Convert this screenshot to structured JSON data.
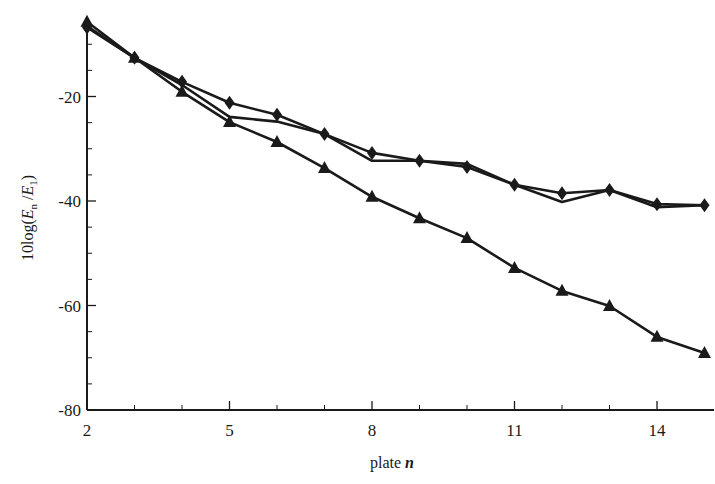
{
  "chart_data": {
    "type": "line",
    "title": "",
    "xlabel": "plate n",
    "ylabel": "10log(E_n /E_1)",
    "xlabel_parts": {
      "text": "plate ",
      "var": "n"
    },
    "ylabel_parts": {
      "prefix": "10log(",
      "v1": "E",
      "s1": "n",
      "mid": " /",
      "v2": "E",
      "s2": "1",
      "suffix": ")"
    },
    "x": [
      2,
      3,
      4,
      5,
      6,
      7,
      8,
      9,
      10,
      11,
      12,
      13,
      14,
      15
    ],
    "xlim": [
      2,
      15.2
    ],
    "ylim": [
      -80,
      -6
    ],
    "xticks": [
      2,
      5,
      8,
      11,
      14
    ],
    "xtick_labels": [
      "2",
      "5",
      "8",
      "11",
      "14"
    ],
    "x_minor_ticks": [
      3,
      4,
      6,
      7,
      9,
      10,
      12,
      13
    ],
    "yticks": [
      -20,
      -40,
      -60,
      -80
    ],
    "ytick_labels": [
      "-20",
      "-40",
      "-60",
      "-80"
    ],
    "y_minor_ticks": [
      -10,
      -15,
      -25,
      -30,
      -35,
      -45,
      -50,
      -55,
      -65,
      -70,
      -75
    ],
    "grid": false,
    "legend": null,
    "series": [
      {
        "name": "diamond",
        "marker": "diamond",
        "color": "#1a1a1a",
        "values": [
          -6.8,
          -12.6,
          -17.2,
          -21.2,
          -23.5,
          -27.2,
          -30.8,
          -32.3,
          -33.5,
          -36.9,
          -38.5,
          -37.9,
          -40.6,
          -40.8
        ]
      },
      {
        "name": "line (no marker)",
        "marker": "none",
        "color": "#1a1a1a",
        "values": [
          -6.5,
          -12.6,
          -17.8,
          -23.9,
          -24.8,
          -27.2,
          -32.3,
          -32.3,
          -32.9,
          -36.9,
          -40.2,
          -37.9,
          -41.2,
          -40.8
        ]
      },
      {
        "name": "triangle",
        "marker": "triangle",
        "color": "#1a1a1a",
        "values": [
          -5.7,
          -12.6,
          -19.1,
          -24.9,
          -28.7,
          -33.7,
          -39.2,
          -43.3,
          -47.1,
          -52.8,
          -57.2,
          -60.1,
          -66.0,
          -69.1
        ]
      }
    ]
  }
}
